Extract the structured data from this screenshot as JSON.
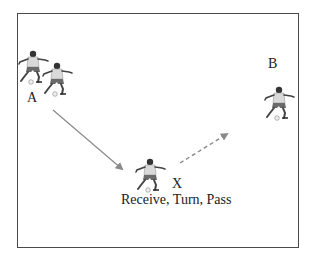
{
  "diagram": {
    "title": "",
    "labels": {
      "a": "A",
      "b": "B",
      "x": "X",
      "action": "Receive, Turn, Pass"
    },
    "players": [
      {
        "id": "a1",
        "group": "A",
        "x": 18,
        "y": 50
      },
      {
        "id": "a2",
        "group": "A",
        "x": 42,
        "y": 62
      },
      {
        "id": "x",
        "group": "X",
        "x": 135,
        "y": 158
      },
      {
        "id": "b",
        "group": "B",
        "x": 264,
        "y": 86
      }
    ],
    "arrows": [
      {
        "id": "pass-a-to-x",
        "style": "solid",
        "from": [
          53,
          110
        ],
        "to": [
          122,
          169
        ]
      },
      {
        "id": "pass-x-to-b",
        "style": "dashed",
        "from": [
          180,
          163
        ],
        "to": [
          227,
          134
        ]
      }
    ],
    "colors": {
      "border": "#4a4a4a",
      "arrow": "#8a8a8a",
      "shirt": "#d8d8d8",
      "shorts": "#6a6a6a",
      "skin": "#3a3a3a"
    }
  }
}
